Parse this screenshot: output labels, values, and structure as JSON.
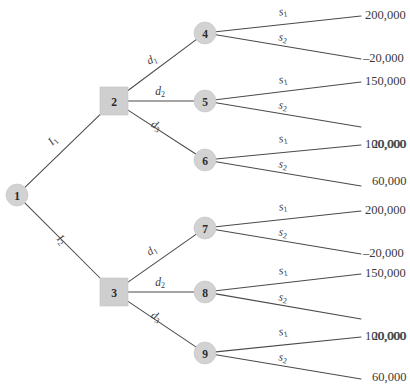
{
  "diagram": {
    "type": "decision-tree",
    "title": "",
    "node_fill_color": "#d2d2d2",
    "line_color": "#4a4a4a",
    "background_color": "#ffffff",
    "nodes": [
      {
        "id": "1",
        "label": "1",
        "shape": "circle",
        "kind": "chance-root",
        "x": 17,
        "y": 195
      },
      {
        "id": "2",
        "label": "2",
        "shape": "square",
        "kind": "decision",
        "x": 114,
        "y": 101
      },
      {
        "id": "3",
        "label": "3",
        "shape": "square",
        "kind": "decision",
        "x": 114,
        "y": 292
      },
      {
        "id": "4",
        "label": "4",
        "shape": "circle",
        "kind": "chance",
        "x": 205,
        "y": 33
      },
      {
        "id": "5",
        "label": "5",
        "shape": "circle",
        "kind": "chance",
        "x": 205,
        "y": 101
      },
      {
        "id": "6",
        "label": "6",
        "shape": "circle",
        "kind": "chance",
        "x": 205,
        "y": 160
      },
      {
        "id": "7",
        "label": "7",
        "shape": "circle",
        "kind": "chance",
        "x": 205,
        "y": 228
      },
      {
        "id": "8",
        "label": "8",
        "shape": "circle",
        "kind": "chance",
        "x": 205,
        "y": 292
      },
      {
        "id": "9",
        "label": "9",
        "shape": "circle",
        "kind": "chance",
        "x": 205,
        "y": 353
      }
    ],
    "edges": [
      {
        "id": "e-1-2",
        "from": "1",
        "to": "2",
        "label": "I",
        "sub": "1",
        "label_x": 53,
        "label_y": 141,
        "rotation": -44
      },
      {
        "id": "e-1-3",
        "from": "1",
        "to": "3",
        "label": "I",
        "sub": "2",
        "label_x": 61,
        "label_y": 240,
        "rotation": 45
      },
      {
        "id": "e-2-4",
        "from": "2",
        "to": "4",
        "label": "d",
        "sub": "1",
        "label_x": 152,
        "label_y": 60,
        "rotation": -26
      },
      {
        "id": "e-2-5",
        "from": "2",
        "to": "5",
        "label": "d",
        "sub": "2",
        "label_x": 160,
        "label_y": 92,
        "rotation": 0
      },
      {
        "id": "e-2-6",
        "from": "2",
        "to": "6",
        "label": "d",
        "sub": "3",
        "label_x": 156,
        "label_y": 126,
        "rotation": 31
      },
      {
        "id": "e-3-7",
        "from": "3",
        "to": "7",
        "label": "d",
        "sub": "1",
        "label_x": 152,
        "label_y": 251,
        "rotation": -33
      },
      {
        "id": "e-3-8",
        "from": "3",
        "to": "8",
        "label": "d",
        "sub": "2",
        "label_x": 160,
        "label_y": 283,
        "rotation": 0
      },
      {
        "id": "e-3-9",
        "from": "3",
        "to": "9",
        "label": "d",
        "sub": "3",
        "label_x": 156,
        "label_y": 317,
        "rotation": 31
      }
    ],
    "outcome_branches": [
      {
        "id": "o-4-s1",
        "from": "4",
        "label": "s",
        "sub": "1",
        "label_x": 283,
        "label_y": 12,
        "rotation": -7,
        "payoff": "200,000",
        "payoff_x": 365,
        "payoff_y": 14,
        "line_end_x": 361,
        "line_end_y": 16
      },
      {
        "id": "o-4-s2",
        "from": "4",
        "label": "s",
        "sub": "2",
        "label_x": 283,
        "label_y": 38,
        "rotation": 9,
        "payoff": "–20,000",
        "payoff_x": 363,
        "payoff_y": 57,
        "line_end_x": 361,
        "line_end_y": 59
      },
      {
        "id": "o-5-s1",
        "from": "5",
        "label": "s",
        "sub": "1",
        "label_x": 283,
        "label_y": 80,
        "rotation": -8,
        "payoff": "150,000",
        "payoff_x": 365,
        "payoff_y": 80,
        "line_end_x": 361,
        "line_end_y": 82
      },
      {
        "id": "o-5-s2",
        "from": "5",
        "label": "s",
        "sub": "2",
        "label_x": 283,
        "label_y": 106,
        "rotation": 9,
        "payoff": "20,000",
        "payoff_x": 372,
        "payoff_y": 143,
        "line_end_x": 361,
        "line_end_y": 127
      },
      {
        "id": "o-6-s1",
        "from": "6",
        "label": "s",
        "sub": "1",
        "label_x": 283,
        "label_y": 139,
        "rotation": -8,
        "payoff": "100,000",
        "payoff_x": 365,
        "payoff_y": 143,
        "line_end_x": 361,
        "line_end_y": 145
      },
      {
        "id": "o-6-s2",
        "from": "6",
        "label": "s",
        "sub": "2",
        "label_x": 283,
        "label_y": 165,
        "rotation": 9,
        "payoff": "60,000",
        "payoff_x": 372,
        "payoff_y": 180,
        "line_end_x": 361,
        "line_end_y": 186
      },
      {
        "id": "o-7-s1",
        "from": "7",
        "label": "s",
        "sub": "1",
        "label_x": 283,
        "label_y": 207,
        "rotation": -7,
        "payoff": "200,000",
        "payoff_x": 365,
        "payoff_y": 209,
        "line_end_x": 361,
        "line_end_y": 211
      },
      {
        "id": "o-7-s2",
        "from": "7",
        "label": "s",
        "sub": "2",
        "label_x": 283,
        "label_y": 233,
        "rotation": 9,
        "payoff": "–20,000",
        "payoff_x": 363,
        "payoff_y": 252,
        "line_end_x": 361,
        "line_end_y": 254
      },
      {
        "id": "o-8-s1",
        "from": "8",
        "label": "s",
        "sub": "1",
        "label_x": 283,
        "label_y": 271,
        "rotation": -8,
        "payoff": "150,000",
        "payoff_x": 365,
        "payoff_y": 272,
        "line_end_x": 361,
        "line_end_y": 274
      },
      {
        "id": "o-8-s2",
        "from": "8",
        "label": "s",
        "sub": "2",
        "label_x": 283,
        "label_y": 298,
        "rotation": 9,
        "payoff": "20,000",
        "payoff_x": 372,
        "payoff_y": 335,
        "line_end_x": 361,
        "line_end_y": 319
      },
      {
        "id": "o-9-s1",
        "from": "9",
        "label": "s",
        "sub": "1",
        "label_x": 283,
        "label_y": 332,
        "rotation": -8,
        "payoff": "100,000",
        "payoff_x": 365,
        "payoff_y": 335,
        "line_end_x": 361,
        "line_end_y": 337
      },
      {
        "id": "o-9-s2",
        "from": "9",
        "label": "s",
        "sub": "2",
        "label_x": 283,
        "label_y": 358,
        "rotation": 9,
        "payoff": "60,000",
        "payoff_x": 372,
        "payoff_y": 376,
        "line_end_x": 361,
        "line_end_y": 379
      }
    ]
  }
}
